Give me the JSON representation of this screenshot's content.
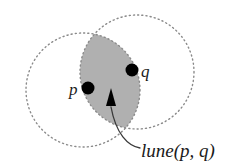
{
  "figure": {
    "background_color": "#ffffff",
    "labels": {
      "point_p": "p",
      "point_q": "q",
      "lune": "lune(p, q)"
    },
    "colors": {
      "lune_fill": "#b0b0b0",
      "circle_stroke": "#8a8a8a",
      "point_fill": "#000000",
      "text": "#1a1a1a",
      "leader_stroke": "#3a3a3a"
    },
    "geometry": {
      "circle_p": {
        "cx": 83,
        "cy": 90,
        "r": 57,
        "style": "dotted"
      },
      "circle_q": {
        "cx": 137,
        "cy": 72,
        "r": 57,
        "style": "dotted"
      },
      "point_p": {
        "cx": 88,
        "cy": 88,
        "r": 6.5
      },
      "point_q": {
        "cx": 132,
        "cy": 70,
        "r": 6.5
      },
      "lune_vertex_top": {
        "x": 96,
        "y": 32
      },
      "lune_vertex_bottom": {
        "x": 124,
        "y": 126
      },
      "arrow_tip": {
        "x": 111,
        "y": 90
      },
      "arrow_base": {
        "x": 111,
        "y": 106
      }
    }
  }
}
